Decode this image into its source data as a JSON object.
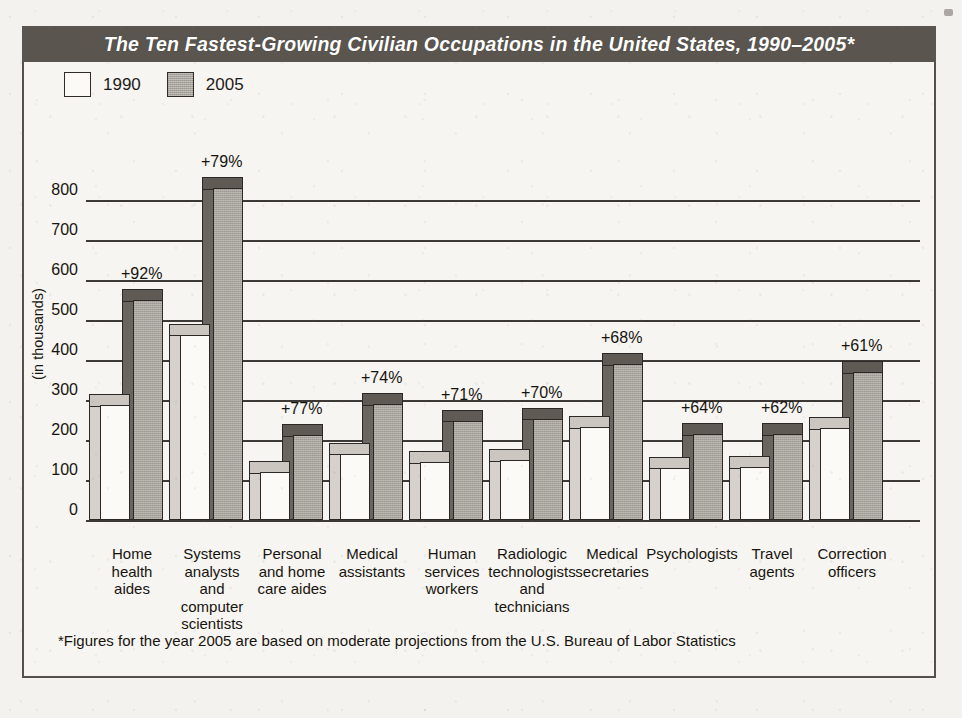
{
  "title": "The Ten Fastest-Growing Civilian Occupations in the United States, 1990–2005*",
  "axis_title": "(in thousands)",
  "footnote": "*Figures for the year 2005 are based on moderate projections from the U.S. Bureau of Labor Statistics",
  "legend": {
    "items": [
      {
        "label": "1990",
        "swatch": "white-square-swatch",
        "color": "#fbfaf7"
      },
      {
        "label": "2005",
        "swatch": "gray-square-swatch",
        "color": "#a9a49c"
      }
    ]
  },
  "colors": {
    "banner": "#5a554e",
    "banner_text": "#ffffff",
    "paper": "#f7f5f1",
    "frame": "#555049",
    "bar_1990": "#fbfaf7",
    "bar_2005": "#a9a49c",
    "gridline": "#3b3835"
  },
  "chart_data": {
    "type": "bar",
    "title": "The Ten Fastest-Growing Civilian Occupations in the United States, 1990–2005*",
    "xlabel": "",
    "ylabel": "(in thousands)",
    "ylim": [
      0,
      800
    ],
    "yticks": [
      0,
      100,
      200,
      300,
      400,
      500,
      600,
      700,
      800
    ],
    "ytick_labels": [
      "0",
      "100",
      "200",
      "300",
      "400",
      "500",
      "600",
      "700",
      "800"
    ],
    "grid": true,
    "legend_position": "top-left",
    "categories": [
      "Home health aides",
      "Systems analysts and computer scientists",
      "Personal and home care aides",
      "Medical assistants",
      "Human services workers",
      "Radiologic technologists and technicians",
      "Medical secretaries",
      "Psychologists",
      "Travel agents",
      "Correction officers"
    ],
    "category_lines": [
      [
        "Home",
        "health",
        "aides"
      ],
      [
        "Systems",
        "analysts",
        "and",
        "computer",
        "scientists"
      ],
      [
        "Personal",
        "and home",
        "care aides"
      ],
      [
        "Medical",
        "assistants"
      ],
      [
        "Human",
        "services",
        "workers"
      ],
      [
        "Radiologic",
        "technologists",
        "and",
        "technicians"
      ],
      [
        "Medical",
        "secretaries"
      ],
      [
        "Psychologists"
      ],
      [
        "Travel",
        "agents"
      ],
      [
        "Correction",
        "officers"
      ]
    ],
    "series": [
      {
        "name": "1990",
        "values": [
          287,
          463,
          120,
          166,
          145,
          149,
          232,
          131,
          132,
          230
        ]
      },
      {
        "name": "2005",
        "values": [
          550,
          829,
          212,
          289,
          248,
          253,
          390,
          215,
          214,
          370
        ]
      }
    ],
    "growth_labels": [
      "+92%",
      "+79%",
      "+77%",
      "+74%",
      "+71%",
      "+70%",
      "+68%",
      "+64%",
      "+62%",
      "+61%"
    ]
  }
}
